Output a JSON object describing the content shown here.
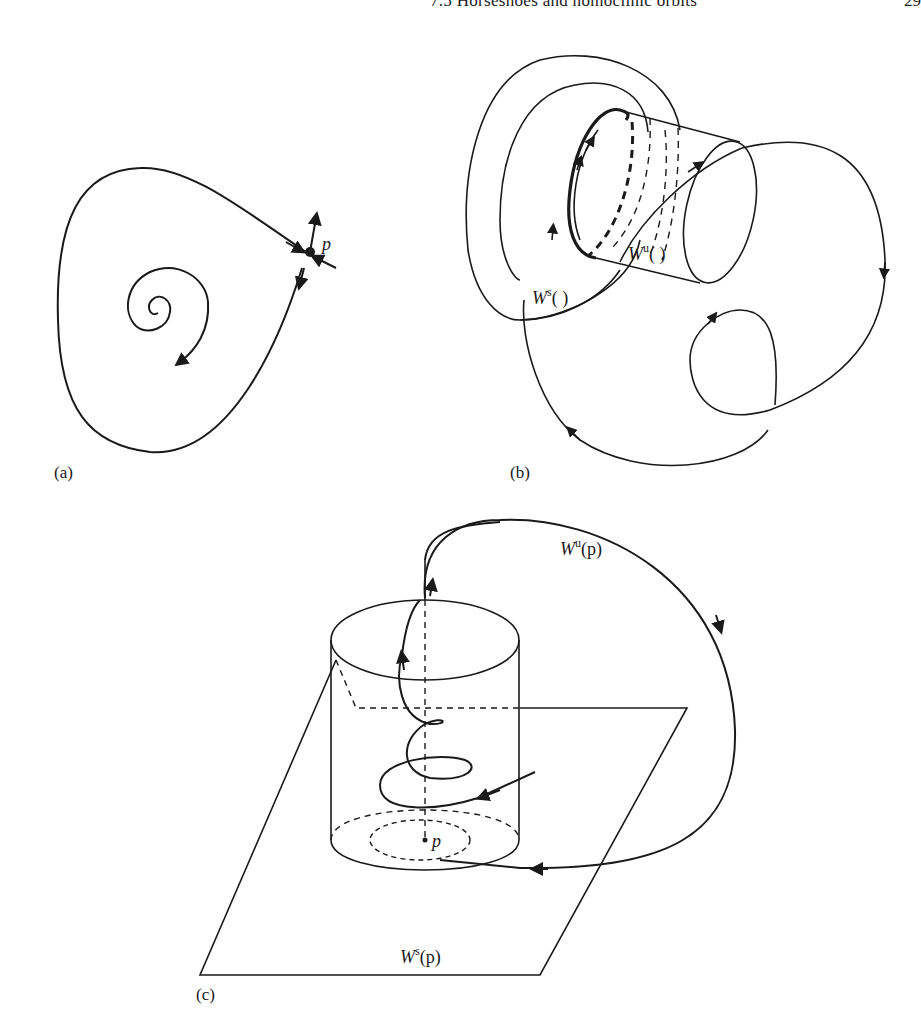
{
  "header": {
    "running_title": "7.5 Horseshoes and homoclinic orbits",
    "page_number": "29"
  },
  "figures": {
    "a": {
      "panel_label": "(a)",
      "point_label": "p"
    },
    "b": {
      "panel_label": "(b)",
      "stable_label_base": "W",
      "stable_label_sup": "s",
      "stable_label_arg": "(   )",
      "unstable_label_base": "W",
      "unstable_label_sup": "u",
      "unstable_label_arg": "(   )"
    },
    "c": {
      "panel_label": "(c)",
      "point_label": "p",
      "unstable_label_base": "W",
      "unstable_label_sup": "u",
      "unstable_label_arg": "(p)",
      "stable_label_base": "W",
      "stable_label_sup": "s",
      "stable_label_arg": "(p)"
    }
  },
  "colors": {
    "ink": "#1a1a1a",
    "paper": "#ffffff"
  }
}
